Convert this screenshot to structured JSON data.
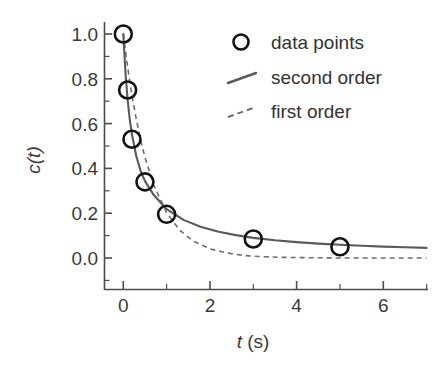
{
  "chart_data": {
    "type": "scatter",
    "title": "",
    "xlabel": "t (s)",
    "xlabel_italic_part": "t",
    "xlabel_rest": " (s)",
    "ylabel": "c(t)",
    "xlim": [
      -0.35,
      7.05
    ],
    "ylim": [
      -0.06,
      1.09
    ],
    "grid": false,
    "legend_position": "upper right",
    "x_ticks": [
      0,
      2,
      4,
      6
    ],
    "x_tick_labels": [
      "0",
      "2",
      "4",
      "6"
    ],
    "x_minor_ticks": [
      1,
      3,
      5,
      7
    ],
    "y_ticks": [
      0.0,
      0.2,
      0.4,
      0.6,
      0.8,
      1.0
    ],
    "y_tick_labels": [
      "0.0",
      "0.2",
      "0.4",
      "0.6",
      "0.8",
      "1.0"
    ],
    "y_minor_ticks": [
      0.1,
      0.3,
      0.5,
      0.7,
      0.9
    ],
    "series": [
      {
        "name": "data points",
        "type": "scatter",
        "marker": "open-circle",
        "color": "#111111",
        "x": [
          0.0,
          0.1,
          0.2,
          0.5,
          1.0,
          3.0,
          5.0
        ],
        "y": [
          1.0,
          0.75,
          0.53,
          0.34,
          0.195,
          0.085,
          0.05
        ]
      },
      {
        "name": "second order",
        "type": "line",
        "style": "solid",
        "color": "#5a5a5a",
        "model": "c(t) = (1 - c_inf)/(1 + k*t) + c_inf",
        "k": 4.4,
        "c_inf": 0.04,
        "x": [
          0.0,
          0.05,
          0.1,
          0.15,
          0.2,
          0.3,
          0.4,
          0.5,
          0.7,
          1.0,
          1.4,
          1.8,
          2.2,
          2.6,
          3.0,
          3.5,
          4.0,
          4.5,
          5.0,
          5.5,
          6.0,
          6.5,
          7.0
        ],
        "y": [
          1.0,
          0.827,
          0.706,
          0.618,
          0.551,
          0.454,
          0.389,
          0.343,
          0.282,
          0.218,
          0.169,
          0.138,
          0.117,
          0.102,
          0.09,
          0.079,
          0.071,
          0.064,
          0.059,
          0.055,
          0.051,
          0.048,
          0.045
        ]
      },
      {
        "name": "first order",
        "type": "line",
        "style": "dashed",
        "color": "#6e6e6e",
        "model": "c(t) = exp(-k*t)",
        "k": 1.6,
        "x": [
          0.0,
          0.1,
          0.2,
          0.3,
          0.4,
          0.5,
          0.7,
          1.0,
          1.3,
          1.6,
          2.0,
          2.4,
          2.8,
          3.2,
          3.6,
          4.0,
          4.5,
          5.0,
          5.5,
          6.0,
          6.5,
          7.0
        ],
        "y": [
          1.0,
          0.852,
          0.726,
          0.619,
          0.527,
          0.449,
          0.326,
          0.202,
          0.125,
          0.077,
          0.041,
          0.022,
          0.011,
          0.006,
          0.003,
          0.002,
          0.001,
          0.0,
          0.0,
          0.0,
          0.0,
          0.0
        ]
      }
    ],
    "legend_entries": [
      {
        "label": "data points",
        "marker": "open-circle",
        "color": "#111111"
      },
      {
        "label": "second order",
        "marker": "solid-line",
        "color": "#5a5a5a"
      },
      {
        "label": "first order",
        "marker": "dashed-line",
        "color": "#6e6e6e"
      }
    ]
  }
}
